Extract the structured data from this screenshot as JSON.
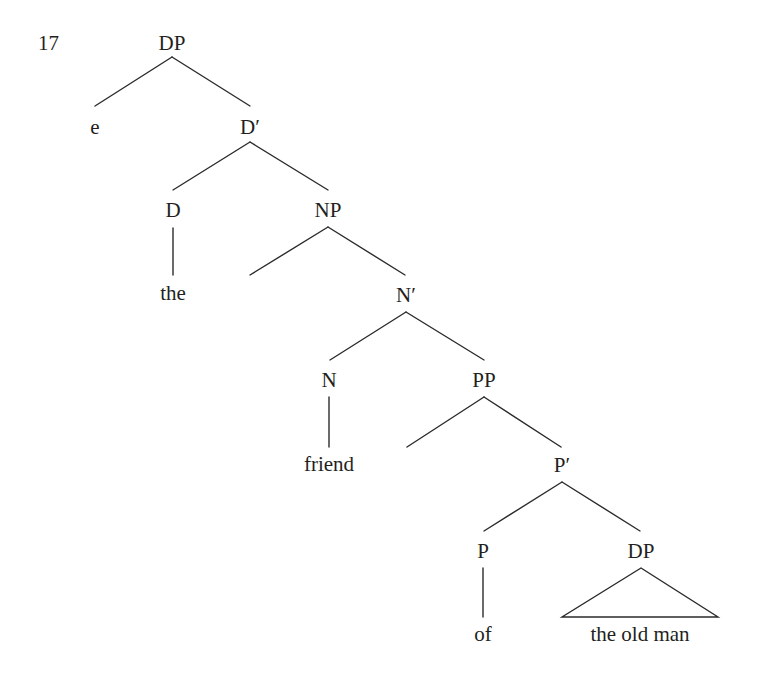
{
  "example": {
    "number": "17"
  },
  "tree": {
    "nodes": {
      "dp_root": {
        "label": "DP",
        "x": 172,
        "y": 32
      },
      "e": {
        "label": "e",
        "x": 95,
        "y": 116
      },
      "d_bar": {
        "label": "D′",
        "x": 250,
        "y": 116
      },
      "d": {
        "label": "D",
        "x": 173,
        "y": 199
      },
      "np": {
        "label": "NP",
        "x": 328,
        "y": 199
      },
      "the": {
        "label": "the",
        "x": 173,
        "y": 282
      },
      "n_bar": {
        "label": "N′",
        "x": 406,
        "y": 284
      },
      "n": {
        "label": "N",
        "x": 329,
        "y": 369
      },
      "pp": {
        "label": "PP",
        "x": 484,
        "y": 369
      },
      "friend": {
        "label": "friend",
        "x": 329,
        "y": 453
      },
      "p_bar": {
        "label": "P′",
        "x": 562,
        "y": 454
      },
      "p": {
        "label": "P",
        "x": 483,
        "y": 540
      },
      "dp_obj": {
        "label": "DP",
        "x": 641,
        "y": 540
      },
      "of": {
        "label": "of",
        "x": 483,
        "y": 623
      },
      "the_old_man": {
        "label": "the old man",
        "x": 640,
        "y": 623
      }
    },
    "edges": [
      {
        "from": "DP",
        "to": "e",
        "x1": 172,
        "y1": 57,
        "x2": 95,
        "y2": 106
      },
      {
        "from": "DP",
        "to": "D′",
        "x1": 172,
        "y1": 57,
        "x2": 250,
        "y2": 106
      },
      {
        "from": "D′",
        "to": "D",
        "x1": 250,
        "y1": 142,
        "x2": 173,
        "y2": 190
      },
      {
        "from": "D′",
        "to": "NP",
        "x1": 250,
        "y1": 142,
        "x2": 328,
        "y2": 190
      },
      {
        "from": "D",
        "to": "the",
        "x1": 173,
        "y1": 228,
        "x2": 173,
        "y2": 275
      },
      {
        "from": "NP",
        "to": "(empty specifier)",
        "x1": 328,
        "y1": 227,
        "x2": 250,
        "y2": 275
      },
      {
        "from": "NP",
        "to": "N′",
        "x1": 328,
        "y1": 227,
        "x2": 405,
        "y2": 275
      },
      {
        "from": "N′",
        "to": "N",
        "x1": 406,
        "y1": 312,
        "x2": 330,
        "y2": 360
      },
      {
        "from": "N′",
        "to": "PP",
        "x1": 406,
        "y1": 312,
        "x2": 484,
        "y2": 360
      },
      {
        "from": "N",
        "to": "friend",
        "x1": 329,
        "y1": 397,
        "x2": 329,
        "y2": 447
      },
      {
        "from": "PP",
        "to": "(empty specifier)",
        "x1": 484,
        "y1": 397,
        "x2": 407,
        "y2": 447
      },
      {
        "from": "PP",
        "to": "P′",
        "x1": 484,
        "y1": 397,
        "x2": 561,
        "y2": 447
      },
      {
        "from": "P′",
        "to": "P",
        "x1": 562,
        "y1": 482,
        "x2": 484,
        "y2": 531
      },
      {
        "from": "P′",
        "to": "DP",
        "x1": 562,
        "y1": 482,
        "x2": 640,
        "y2": 531
      },
      {
        "from": "P",
        "to": "of",
        "x1": 483,
        "y1": 568,
        "x2": 483,
        "y2": 617
      }
    ],
    "triangle": {
      "from": "DP",
      "covers": "the old man",
      "apex_x": 641,
      "apex_y": 568,
      "base_left_x": 562,
      "base_right_x": 718,
      "base_y": 617
    },
    "stroke_color": "#2b2b2b"
  }
}
